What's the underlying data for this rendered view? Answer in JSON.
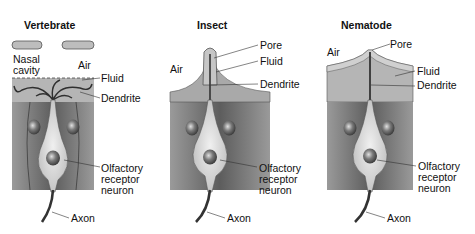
{
  "panels": [
    {
      "title": "Vertebrate",
      "labels": {
        "nasal_cavity_1": "Nasal",
        "nasal_cavity_2": "cavity",
        "air": "Air",
        "fluid": "Fluid",
        "dendrite": "Dendrite",
        "neuron_1": "Olfactory",
        "neuron_2": "receptor",
        "neuron_3": "neuron",
        "axon": "Axon"
      }
    },
    {
      "title": "Insect",
      "labels": {
        "air": "Air",
        "pore": "Pore",
        "fluid": "Fluid",
        "dendrite": "Dendrite",
        "neuron_1": "Olfactory",
        "neuron_2": "receptor",
        "neuron_3": "neuron",
        "axon": "Axon"
      }
    },
    {
      "title": "Nematode",
      "labels": {
        "air": "Air",
        "pore": "Pore",
        "fluid": "Fluid",
        "dendrite": "Dendrite",
        "neuron_1": "Olfactory",
        "neuron_2": "receptor",
        "neuron_3": "neuron",
        "axon": "Axon"
      }
    }
  ],
  "colors": {
    "tissue_dark": "#5a5a5a",
    "tissue_mid": "#8a8a8a",
    "fluid": "#b9b9b9",
    "neuron": "#d8d8d8",
    "nucleus": "#6f6f6f",
    "axon": "#333333"
  }
}
